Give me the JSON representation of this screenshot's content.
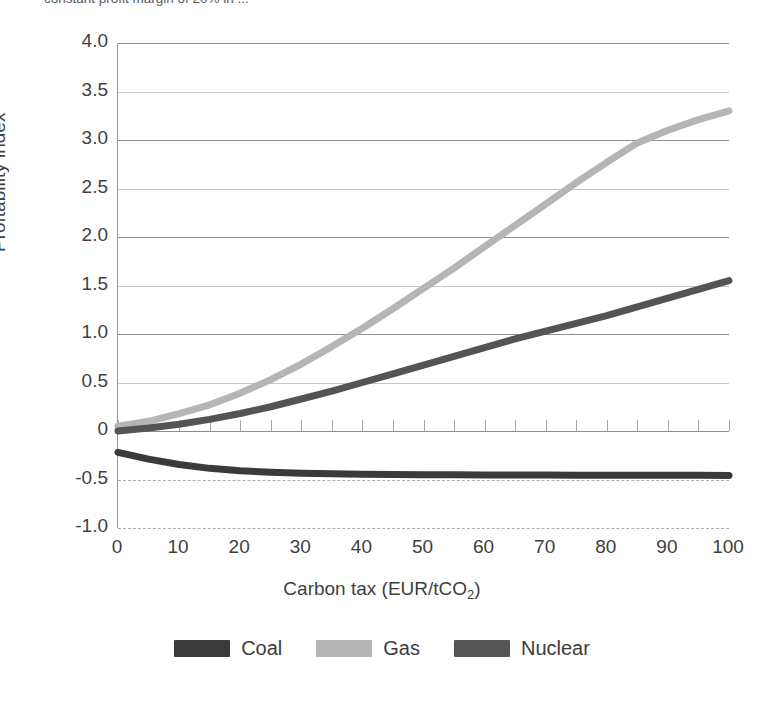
{
  "top_caption": "constant profit margin of 20% in ...",
  "chart_data": {
    "type": "line",
    "title": "",
    "xlabel": "Carbon tax (EUR/tCO2)",
    "xlabel_base": "Carbon tax (EUR/tCO",
    "xlabel_sub": "2",
    "xlabel_tail": ")",
    "ylabel": "Proftability index",
    "xlim": [
      0,
      100
    ],
    "ylim": [
      -1.0,
      4.0
    ],
    "grid": true,
    "legend_position": "bottom",
    "xticks": [
      "0",
      "10",
      "20",
      "30",
      "40",
      "50",
      "60",
      "70",
      "80",
      "90",
      "100"
    ],
    "xtick_values": [
      0,
      10,
      20,
      30,
      40,
      50,
      60,
      70,
      80,
      90,
      100
    ],
    "yticks": [
      "4.0",
      "3.5",
      "3.0",
      "2.5",
      "2.0",
      "1.5",
      "1.0",
      "0.5",
      "0",
      "-0.5",
      "-1.0"
    ],
    "ytick_values": [
      4.0,
      3.5,
      3.0,
      2.5,
      2.0,
      1.5,
      1.0,
      0.5,
      0,
      -0.5,
      -1.0
    ],
    "dashed_gridlines": [
      -0.5,
      -1.0
    ],
    "zero_line": 0,
    "zero_line_tick_step": 5,
    "x": [
      0,
      5,
      10,
      15,
      20,
      25,
      30,
      35,
      40,
      45,
      50,
      55,
      60,
      65,
      70,
      75,
      80,
      85,
      90,
      95,
      100
    ],
    "series": [
      {
        "name": "Coal",
        "color": "#3a3a3a",
        "values": [
          -0.22,
          -0.29,
          -0.345,
          -0.385,
          -0.41,
          -0.425,
          -0.435,
          -0.442,
          -0.446,
          -0.449,
          -0.451,
          -0.452,
          -0.453,
          -0.454,
          -0.4545,
          -0.455,
          -0.4555,
          -0.456,
          -0.4565,
          -0.457,
          -0.4575
        ]
      },
      {
        "name": "Gas",
        "color": "#b5b5b5",
        "values": [
          0.05,
          0.1,
          0.18,
          0.27,
          0.39,
          0.53,
          0.69,
          0.87,
          1.06,
          1.26,
          1.47,
          1.68,
          1.9,
          2.12,
          2.34,
          2.56,
          2.77,
          2.97,
          3.1,
          3.21,
          3.3
        ]
      },
      {
        "name": "Nuclear",
        "color": "#545454",
        "values": [
          0.0,
          0.03,
          0.07,
          0.12,
          0.18,
          0.25,
          0.33,
          0.41,
          0.5,
          0.59,
          0.68,
          0.77,
          0.86,
          0.95,
          1.03,
          1.11,
          1.19,
          1.28,
          1.37,
          1.46,
          1.55
        ]
      }
    ]
  },
  "legend": {
    "items": [
      {
        "label": "Coal",
        "color": "#3a3a3a"
      },
      {
        "label": "Gas",
        "color": "#b5b5b5"
      },
      {
        "label": "Nuclear",
        "color": "#545454"
      }
    ]
  }
}
